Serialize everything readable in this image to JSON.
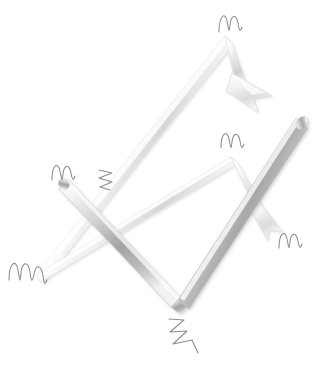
{
  "canvas": {
    "width": 320,
    "height": 375,
    "background_color": "#ffffff",
    "title": "Two interlocking glossy metallic zigzag arrows with pencil scribble marks",
    "style": "3d-glossy-metallic-greyscale"
  },
  "palette": {
    "background": "#ffffff",
    "metal_highlight": "#ffffff",
    "metal_light": "#f2f2f2",
    "metal_mid": "#c9c9c9",
    "metal_shadow": "#9a9a9a",
    "metal_dark": "#8a8a8a",
    "metal_edge": "#dedede",
    "scribble_stroke": "#8d8d8d",
    "scribble_stroke_dark": "#6f6f6f"
  },
  "shapes": [
    {
      "id": "arrow-light-upward",
      "name": "light-zigzag-arrow",
      "description": "Pale 3D arrow rising from lower-left tip up to a high peak then descending to an arrowhead at upper right",
      "tone": "light",
      "path_points": [
        {
          "x": 36,
          "y": 274
        },
        {
          "x": 226,
          "y": 36
        },
        {
          "x": 252,
          "y": 86
        }
      ],
      "has_arrowhead": true,
      "arrowhead_position": {
        "x": 254,
        "y": 90
      },
      "arrowhead_direction": "down-right",
      "stroke_width": 9
    },
    {
      "id": "arrow-light-secondary",
      "name": "light-chevron-arrow",
      "description": "Pale 3D chevron from lower-left tip rising to a peak near center-right, then descending to a small arrowhead at right",
      "tone": "light",
      "path_points": [
        {
          "x": 36,
          "y": 274
        },
        {
          "x": 232,
          "y": 157
        },
        {
          "x": 276,
          "y": 226
        }
      ],
      "has_arrowhead": true,
      "arrowhead_position": {
        "x": 275,
        "y": 224
      },
      "arrowhead_direction": "down-right",
      "stroke_width": 8
    },
    {
      "id": "arrow-dark-checkmark",
      "name": "dark-zigzag-checkmark",
      "description": "Darker shaded 3D zigzag forming a tall checkmark: from left peak down to bottom vertex then up to the long thick bar at upper right",
      "tone": "dark",
      "path_points": [
        {
          "x": 68,
          "y": 180
        },
        {
          "x": 178,
          "y": 300
        },
        {
          "x": 300,
          "y": 122
        }
      ],
      "has_arrowhead": false,
      "stroke_width": 15
    }
  ],
  "scribbles": [
    {
      "id": "scribble-top",
      "name": "pencil-scribble-m",
      "glyph_type": "m-wave",
      "x": 228,
      "y": 22,
      "rotation": -8,
      "scale": 1.0
    },
    {
      "id": "scribble-mid-right",
      "name": "pencil-scribble-m",
      "glyph_type": "m-wave",
      "x": 230,
      "y": 140,
      "rotation": -5,
      "scale": 0.95
    },
    {
      "id": "scribble-left-upper",
      "name": "pencil-scribble-m",
      "glyph_type": "m-wave",
      "x": 62,
      "y": 172,
      "rotation": -4,
      "scale": 0.95
    },
    {
      "id": "scribble-center-zigzag",
      "name": "pencil-scribble-zigzag",
      "glyph_type": "zigzag-vertical",
      "x": 104,
      "y": 178,
      "rotation": 0,
      "scale": 0.8
    },
    {
      "id": "scribble-right-lower",
      "name": "pencil-scribble-m",
      "glyph_type": "m-wave",
      "x": 288,
      "y": 238,
      "rotation": 6,
      "scale": 0.9
    },
    {
      "id": "scribble-left-lower",
      "name": "pencil-scribble-w",
      "glyph_type": "w-wave",
      "x": 24,
      "y": 272,
      "rotation": 0,
      "scale": 1.1
    },
    {
      "id": "scribble-bottom",
      "name": "pencil-scribble-zigzag",
      "glyph_type": "zigzag-diagonal",
      "x": 176,
      "y": 318,
      "rotation": 0,
      "scale": 1.0
    }
  ],
  "labels": {
    "figure_caption": "",
    "alt_text": "Abstract grayscale illustration of two crossing glossy arrows with sketchy pencil marks"
  }
}
